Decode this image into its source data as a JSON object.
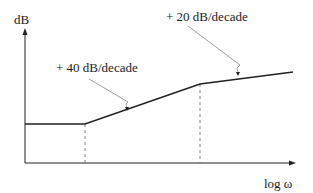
{
  "diagram": {
    "type": "bode-magnitude-asymptote",
    "y_axis_label": "dB",
    "x_axis_label": "log ω",
    "annotations": [
      {
        "text": "+ 40 dB/decade"
      },
      {
        "text": "+ 20 dB/decade"
      }
    ],
    "segments": [
      {
        "slope": "0 dB/decade"
      },
      {
        "slope": "+40 dB/decade"
      },
      {
        "slope": "+20 dB/decade"
      }
    ]
  }
}
